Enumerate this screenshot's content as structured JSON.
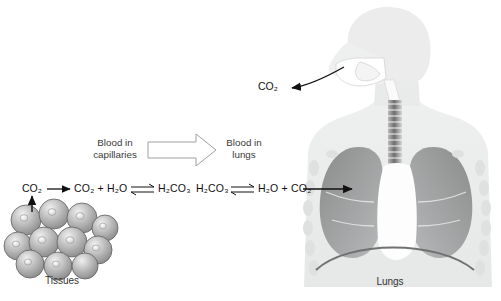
{
  "diagram": {
    "title_alt": "Carbon dioxide transport from tissues to lungs",
    "background": "#ffffff"
  },
  "equation": {
    "co2_source": "CO",
    "co2_source_sub": "2",
    "terms": [
      {
        "id": "t1",
        "text": "CO",
        "sub": "2",
        "tail": " + H",
        "sub2": "2",
        "tail2": "O"
      },
      {
        "id": "t2",
        "text": "H",
        "sub": "2",
        "tail": "CO",
        "sub2": "3",
        "tail2": ""
      },
      {
        "id": "t3",
        "text": "H",
        "sub": "2",
        "tail": "CO",
        "sub2": "3",
        "tail2": ""
      },
      {
        "id": "t4",
        "text": "H",
        "sub": "2",
        "tail": "O + CO",
        "sub2": "2",
        "tail2": ""
      }
    ],
    "left_co2": "CO₂",
    "term_a": "CO₂ + H₂O",
    "term_b": "H₂CO₃",
    "term_c": "H₂CO₃",
    "term_d": "H₂O + CO₂",
    "equilibrium_symbol": "⇌",
    "arrow_symbol": "→"
  },
  "flow": {
    "left_label_line1": "Blood in",
    "left_label_line2": "capillaries",
    "right_label_line1": "Blood in",
    "right_label_line2": "lungs",
    "arrow_direction": "right"
  },
  "labels": {
    "tissues": "Tissues",
    "lungs": "Lungs",
    "exhaled_co2": "CO₂"
  },
  "colors": {
    "body_silhouette": "#eceded",
    "lung_fill_dark": "#8d8d8d",
    "lung_fill_light": "#b9bcbd",
    "heart_white": "#fcfcfc",
    "rib_oval": "#dcdedd",
    "diaphragm_stroke": "#6f7271",
    "cell_edge": "#6b6b6b",
    "cell_mid": "#b5b5b5",
    "cell_light": "#e4e4e4",
    "arrow_black": "#111111",
    "flow_arrow_stroke": "#9a9a9a",
    "text": "#1a1a1a"
  },
  "cells": {
    "count": 11,
    "description": "cluster of overlapping gray spherical tissue cells with nuclei"
  },
  "anatomy": {
    "parts": [
      "head",
      "nasal-cavity",
      "oral-cavity",
      "pharynx",
      "trachea",
      "bronchi",
      "left-lung",
      "right-lung",
      "heart",
      "ribs",
      "diaphragm",
      "torso"
    ]
  }
}
